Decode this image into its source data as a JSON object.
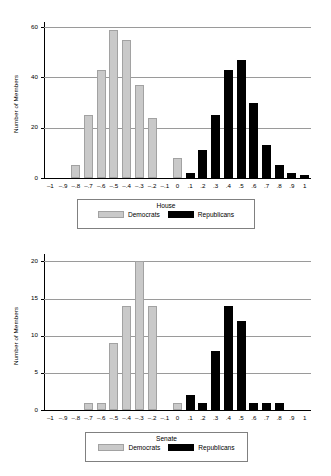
{
  "chart_data": [
    {
      "type": "bar",
      "title": "House",
      "xlabel": "",
      "ylabel": "Number of Members",
      "ylim": [
        0,
        62
      ],
      "yticks": [
        0,
        20,
        40,
        60
      ],
      "grid": true,
      "legend_position": "bottom",
      "categories": [
        "-1",
        "-.9",
        "-.8",
        "-.7",
        "-.6",
        "-.5",
        "-.4",
        "-.3",
        "-.2",
        "-.1",
        "0",
        ".1",
        ".2",
        ".3",
        ".4",
        ".5",
        ".6",
        ".7",
        ".8",
        ".9",
        "1"
      ],
      "series": [
        {
          "name": "Democrats",
          "color": "#c9c9c9",
          "values": [
            0,
            0,
            5,
            25,
            43,
            59,
            55,
            37,
            24,
            0,
            8,
            0,
            0,
            0,
            0,
            0,
            0,
            0,
            0,
            0,
            0
          ]
        },
        {
          "name": "Republicans",
          "color": "#000000",
          "values": [
            0,
            0,
            0,
            0,
            0,
            0,
            0,
            0,
            0,
            0,
            0,
            2,
            11,
            25,
            43,
            47,
            30,
            13,
            5,
            2,
            1
          ]
        }
      ]
    },
    {
      "type": "bar",
      "title": "Senate",
      "xlabel": "",
      "ylabel": "Number of Members",
      "ylim": [
        0,
        21
      ],
      "yticks": [
        0,
        5,
        10,
        15,
        20
      ],
      "grid": true,
      "legend_position": "bottom",
      "categories": [
        "-1",
        "-.9",
        "-.8",
        "-.7",
        "-.6",
        "-.5",
        "-.4",
        "-.3",
        "-.2",
        "-.1",
        "0",
        ".1",
        ".2",
        ".3",
        ".4",
        ".5",
        ".6",
        ".7",
        ".8",
        ".9",
        "1"
      ],
      "series": [
        {
          "name": "Democrats",
          "color": "#c9c9c9",
          "values": [
            0,
            0,
            0,
            1,
            1,
            9,
            14,
            20,
            14,
            0,
            1,
            0,
            0,
            0,
            0,
            0,
            0,
            0,
            0,
            0,
            0
          ]
        },
        {
          "name": "Republicans",
          "color": "#000000",
          "values": [
            0,
            0,
            0,
            0,
            0,
            0,
            0,
            0,
            0,
            0,
            0,
            2,
            1,
            8,
            14,
            12,
            1,
            1,
            1,
            0,
            0
          ]
        }
      ]
    }
  ],
  "house": {
    "ylabel": "Number of Members",
    "legend": {
      "title": "House",
      "democrats": "Democrats",
      "republicans": "Republicans"
    }
  },
  "senate": {
    "ylabel": "Number of Members",
    "legend": {
      "title": "Senate",
      "democrats": "Democrats",
      "republicans": "Republicans"
    }
  },
  "colors": {
    "democrat": "#c9c9c9",
    "republican": "#000000",
    "grid": "#9a9a9a",
    "axis": "#000000"
  }
}
